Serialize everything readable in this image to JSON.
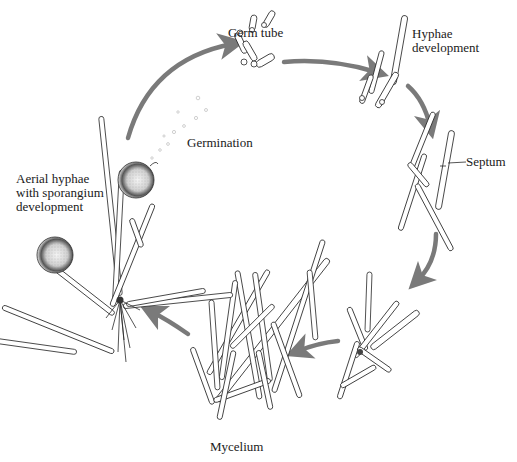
{
  "diagram": {
    "type": "life-cycle",
    "colors": {
      "arrow": "#7a7a7a",
      "ink": "#2a2a2a",
      "sporangium_shade": "#3a3a3a",
      "background": "#ffffff"
    },
    "labels": {
      "germ_tube": "Germ tube",
      "germination": "Germination",
      "hyphae_development": "Hyphae\ndevelopment",
      "septum": "Septum",
      "mycelium": "Mycelium",
      "aerial_hyphae": "Aerial hyphae\nwith sporangium\ndevelopment"
    },
    "stages": [
      {
        "id": "germination",
        "label": "Germination"
      },
      {
        "id": "germ-tube",
        "label": "Germ tube"
      },
      {
        "id": "hyphae-development",
        "label": "Hyphae development"
      },
      {
        "id": "septum",
        "label": "Septum"
      },
      {
        "id": "branching",
        "label": ""
      },
      {
        "id": "mycelium",
        "label": "Mycelium"
      },
      {
        "id": "aerial-hyphae",
        "label": "Aerial hyphae with sporangium development"
      }
    ],
    "arrows": [
      {
        "from": "aerial-hyphae",
        "to": "germ-tube"
      },
      {
        "from": "germ-tube",
        "to": "hyphae-development"
      },
      {
        "from": "hyphae-development",
        "to": "septum"
      },
      {
        "from": "septum",
        "to": "branching"
      },
      {
        "from": "branching",
        "to": "mycelium"
      },
      {
        "from": "mycelium",
        "to": "aerial-hyphae"
      }
    ]
  }
}
